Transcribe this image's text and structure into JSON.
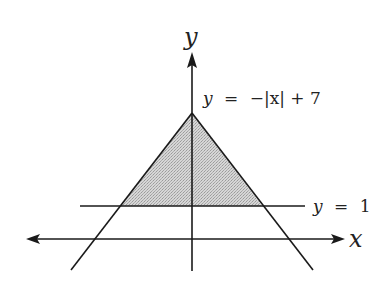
{
  "figure": {
    "type": "diagram",
    "colors": {
      "stroke": "#1a1a1a",
      "fill_region": "#c9c9c9",
      "text": "#222222",
      "background": "#ffffff"
    },
    "axes": {
      "x_label": "x",
      "y_label": "y"
    },
    "curves": [
      {
        "id": "abs",
        "label_lhs": "y",
        "label_eq": "=",
        "label_rhs": "−|x| + 7",
        "label": "y = −|x| + 7"
      },
      {
        "id": "horizontal",
        "label_lhs": "y",
        "label_eq": "=",
        "label_rhs": "1",
        "label": "y = 1"
      }
    ],
    "shaded_region": "triangle between y = −|x| + 7 and y = 1"
  }
}
